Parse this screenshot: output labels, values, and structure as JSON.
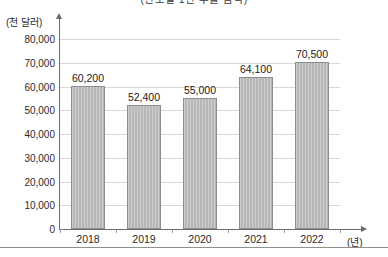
{
  "chart_data": {
    "type": "bar",
    "title": "(연도별 1인 수출 금액)",
    "xlabel": "(년)",
    "ylabel": "(천 달러)",
    "categories": [
      "2018",
      "2019",
      "2020",
      "2021",
      "2022"
    ],
    "values": [
      60200,
      52400,
      55000,
      64100,
      70500
    ],
    "value_labels": [
      "60,200",
      "52,400",
      "55,000",
      "64,100",
      "70,500"
    ],
    "ylim": [
      0,
      80000
    ],
    "ytick_values": [
      80000,
      70000,
      60000,
      50000,
      40000,
      30000,
      20000,
      10000,
      0
    ],
    "ytick_labels": [
      "80,000",
      "70,000",
      "60,000",
      "50,000",
      "40,000",
      "30,000",
      "20,000",
      "10,000",
      "0"
    ],
    "grid": true,
    "legend": false,
    "series_color": "#b7b7b7",
    "series_border_color": "#8d8d8d",
    "gridline_color": "#d8d8d8",
    "axis_color": "#6b6b6b"
  },
  "axes": {
    "y_unit": "(천 달러)",
    "x_unit": "(년)"
  }
}
